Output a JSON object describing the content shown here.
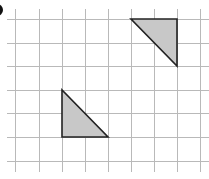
{
  "figure": {
    "grid": {
      "x_lines": [
        15,
        39,
        62,
        85,
        108,
        131,
        154,
        177,
        200
      ],
      "y_lines": [
        19,
        43,
        66,
        90,
        113,
        137,
        161
      ],
      "line_color": "#b9b9b9",
      "extend_x": [
        7,
        209
      ],
      "extend_y": [
        9,
        172
      ]
    },
    "shapes": [
      {
        "name": "triangle-upper-right",
        "points": [
          [
            131,
            19
          ],
          [
            177,
            19
          ],
          [
            177,
            66
          ]
        ],
        "fill": "#c8c8c8",
        "stroke": "#222222"
      },
      {
        "name": "triangle-lower-left",
        "points": [
          [
            62,
            90
          ],
          [
            62,
            137
          ],
          [
            108,
            137
          ]
        ],
        "fill": "#c8c8c8",
        "stroke": "#222222"
      }
    ]
  }
}
